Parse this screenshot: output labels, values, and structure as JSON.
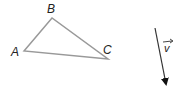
{
  "diagram": {
    "triangle": {
      "vertices": [
        {
          "name": "A",
          "x": 24,
          "y": 51
        },
        {
          "name": "B",
          "x": 52,
          "y": 18
        },
        {
          "name": "C",
          "x": 108,
          "y": 59
        }
      ],
      "labels": {
        "A": "A",
        "B": "B",
        "C": "C"
      },
      "stroke": "#999999"
    },
    "vector": {
      "label": "v",
      "start": {
        "x": 155,
        "y": 28
      },
      "end": {
        "x": 167,
        "y": 88
      },
      "stroke": "#333333"
    }
  }
}
